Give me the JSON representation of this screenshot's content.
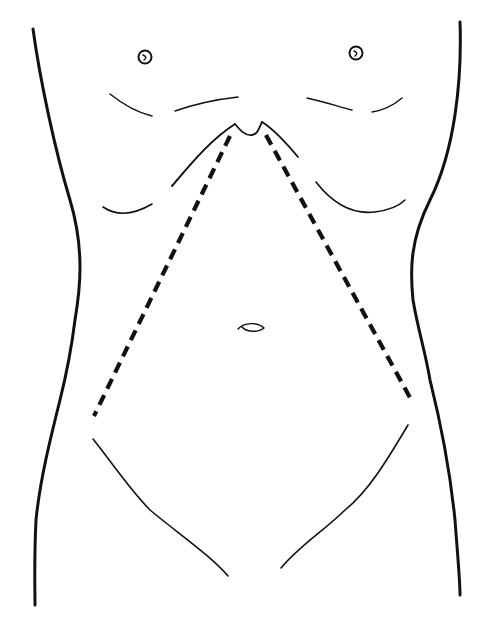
{
  "figure": {
    "type": "anatomical line drawing",
    "annotation": "dashed incision lines from xiphoid toward left and right anterior superior iliac spine",
    "colors": {
      "line": "#111111",
      "background": "#ffffff"
    }
  },
  "caption": ""
}
